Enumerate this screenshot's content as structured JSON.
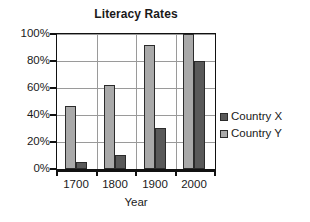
{
  "chart_data": {
    "type": "bar",
    "title": "Literacy Rates",
    "xlabel": "Year",
    "ylabel": "",
    "categories": [
      "1700",
      "1800",
      "1900",
      "2000"
    ],
    "series": [
      {
        "name": "Country X",
        "color": "#595959",
        "values": [
          5,
          10,
          30,
          80
        ]
      },
      {
        "name": "Country Y",
        "color": "#a9a9a9",
        "values": [
          47,
          62,
          92,
          100
        ]
      }
    ],
    "plot_order": [
      "Country Y",
      "Country X"
    ],
    "ylim": [
      0,
      100
    ],
    "ytick_values": [
      0,
      20,
      40,
      60,
      80,
      100
    ],
    "ytick_labels": [
      "0%",
      "20%",
      "40%",
      "60%",
      "80%",
      "100%"
    ],
    "grid": {
      "horizontal": true,
      "vertical": true,
      "color": "#9a9a9a"
    },
    "legend": {
      "position": "right",
      "entries": [
        "Country X",
        "Country Y"
      ]
    },
    "frame": {
      "border_color": "#111111",
      "background": "#ffffff"
    }
  }
}
